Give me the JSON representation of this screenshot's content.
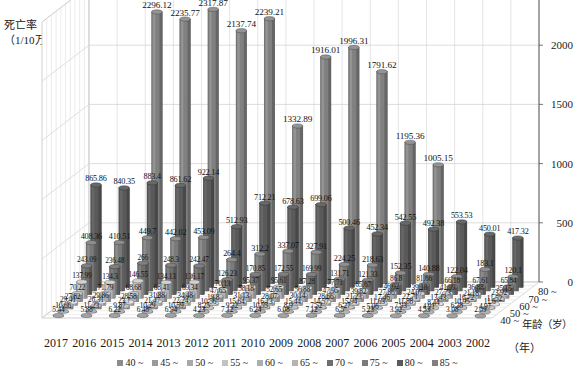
{
  "axes": {
    "y_title_line1": "死亡率",
    "y_title_line2": "（1/10万）",
    "y_ticks": [
      0,
      500,
      1000,
      1500,
      2000,
      2500
    ],
    "y_max": 2500,
    "x_unit": "（年）",
    "depth_title": "年龄（岁）",
    "depth_labels": [
      "40 ~",
      "50 ~",
      "60 ~",
      "70 ~",
      "80 ~"
    ]
  },
  "legend": {
    "items": [
      {
        "label": "40 ~",
        "color": "#8c8c8c"
      },
      {
        "label": "45 ~",
        "color": "#9a9a9a"
      },
      {
        "label": "50 ~",
        "color": "#a8a8a8"
      },
      {
        "label": "55 ~",
        "color": "#c2c2c2"
      },
      {
        "label": "60 ~",
        "color": "#aeaeae"
      },
      {
        "label": "65 ~",
        "color": "#b4b4b4"
      },
      {
        "label": "70 ~",
        "color": "#6e6e6e"
      },
      {
        "label": "75 ~",
        "color": "#7a7a7a"
      },
      {
        "label": "80 ~",
        "color": "#5a5a5a"
      },
      {
        "label": "85 ~",
        "color": "#808080"
      }
    ]
  },
  "chart_data": {
    "type": "bar",
    "title": "",
    "xlabel": "（年）",
    "ylabel": "死亡率（1/10万）",
    "zlabel": "年龄（岁）",
    "ylim": [
      0,
      2500
    ],
    "grid": true,
    "legend_position": "bottom",
    "categories": [
      "2017",
      "2016",
      "2015",
      "2014",
      "2013",
      "2012",
      "2011",
      "2010",
      "2009",
      "2008",
      "2007",
      "2006",
      "2005",
      "2004",
      "2003",
      "2002"
    ],
    "series": [
      {
        "name": "40 ~",
        "values": [
          5.44,
          5.88,
          6.22,
          6.48,
          6.94,
          4.23,
          7.12,
          6.24,
          6.08,
          7.12,
          6.5,
          5.23,
          3.92,
          4.53,
          3.08,
          2.09
        ]
      },
      {
        "name": "45 ~",
        "values": [
          10.66,
          11.23,
          9.87,
          10.29,
          10.59,
          8.25,
          9.32,
          10.55,
          8.9,
          7.52,
          6.27,
          5.06,
          7.93,
          4.91,
          6.38,
          4.97
        ]
      },
      {
        "name": "50 ~",
        "values": [
          29.41,
          26.31,
          23.7,
          21.47,
          22.24,
          10.56,
          15.64,
          16.13,
          15.44,
          14.57,
          15.94,
          11.63,
          11.88,
          8.44,
          10.95,
          11.6
        ]
      },
      {
        "name": "55 ~",
        "values": [
          27.82,
          29.86,
          28.58,
          31.88,
          34.48,
          19.8,
          31.13,
          28.07,
          30.14,
          28.66,
          21.23,
          17.46,
          22.71,
          13.43,
          16.72,
          11.52
        ]
      },
      {
        "name": "60 ~",
        "values": [
          70.22,
          71.79,
          68.68,
          68.41,
          69.34,
          47.65,
          58.18,
          52.65,
          56.88,
          47.95,
          39.82,
          27.86,
          24.07,
          27.73,
          21.18,
          23.92
        ]
      },
      {
        "name": "65 ~",
        "values": [
          137.99,
          134.3,
          146.55,
          134.13,
          136.17,
          70.13,
          95.37,
          95.61,
          87.28,
          77.71,
          65.67,
          46.02,
          39.18,
          41.99,
          36.88,
          35.15
        ]
      },
      {
        "name": "70 ~",
        "values": [
          243.09,
          236.48,
          266.0,
          248.3,
          242.47,
          126.23,
          170.85,
          172.55,
          169.99,
          131.71,
          121.33,
          86.8,
          81.66,
          66.18,
          67.61,
          65.84
        ]
      },
      {
        "name": "75 ~",
        "values": [
          408.36,
          410.51,
          449.7,
          442.02,
          453.09,
          264.4,
          312.2,
          337.07,
          327.91,
          224.25,
          218.63,
          152.35,
          140.88,
          122.04,
          183.1,
          120.1
        ]
      },
      {
        "name": "80 ~",
        "values": [
          865.86,
          840.35,
          883.4,
          861.62,
          922.14,
          512.93,
          712.21,
          678.63,
          699.06,
          500.46,
          452.34,
          542.55,
          492.38,
          553.53,
          450.01,
          417.32
        ]
      },
      {
        "name": "85 ~",
        "values": [
          null,
          null,
          2296.12,
          2235.77,
          2317.87,
          2137.74,
          2239.21,
          1332.89,
          1916.01,
          1996.31,
          1791.62,
          1195.36,
          1005.15,
          null,
          null,
          null
        ]
      }
    ]
  }
}
